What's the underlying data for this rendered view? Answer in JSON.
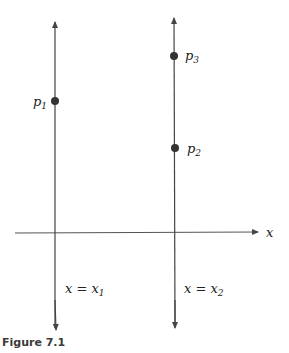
{
  "figure": {
    "caption": "Figure 7.1",
    "axis_label": "x",
    "lines": [
      {
        "label_var": "x",
        "label_eq": " = ",
        "label_rhs": "x",
        "label_sub": "1"
      },
      {
        "label_var": "x",
        "label_eq": " = ",
        "label_rhs": "x",
        "label_sub": "2"
      }
    ],
    "points": [
      {
        "name": "p",
        "sub": "1"
      },
      {
        "name": "p",
        "sub": "2"
      },
      {
        "name": "p",
        "sub": "3"
      }
    ],
    "colors": {
      "stroke": "#444444",
      "point": "#333333"
    }
  }
}
